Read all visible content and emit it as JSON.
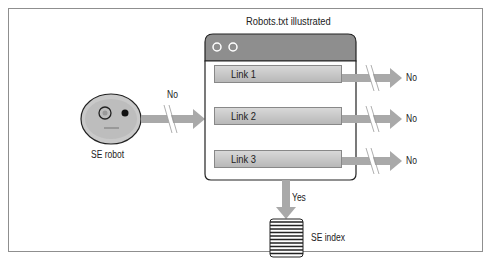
{
  "title": "Robots.txt illustrated",
  "robot": {
    "label": "SE robot",
    "arrow_label": "No"
  },
  "window": {
    "links": [
      {
        "label": "Link 1",
        "result": "No"
      },
      {
        "label": "Link 2",
        "result": "No"
      },
      {
        "label": "Link 3",
        "result": "No"
      }
    ]
  },
  "index": {
    "label": "SE index",
    "arrow_label": "Yes"
  },
  "colors": {
    "arrow": "#a9a9a9",
    "window_titlebar": "#8e8e8e",
    "robot_face": "#c8c8c8",
    "frame_border": "#8f8f8f"
  }
}
